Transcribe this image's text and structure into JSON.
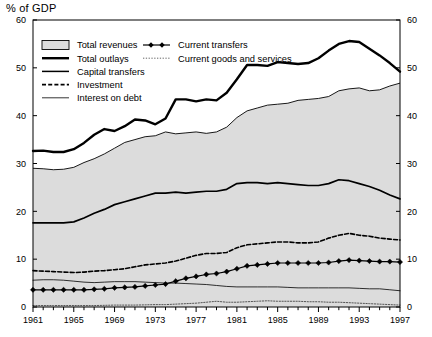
{
  "axis_title": "% of GDP",
  "legend": {
    "col1": [
      {
        "label": "Total revenues",
        "style": "area-swatch"
      },
      {
        "label": "Total outlays",
        "style": "thick-line"
      },
      {
        "label": "Capital transfers",
        "style": "medium-line"
      },
      {
        "label": "Investment",
        "style": "dashed-line"
      },
      {
        "label": "Interest on debt",
        "style": "thin-line"
      }
    ],
    "col2": [
      {
        "label": "Current transfers",
        "style": "marker-line"
      },
      {
        "label": "Current goods and services",
        "style": "dotted-line"
      }
    ]
  },
  "chart_data": {
    "type": "line",
    "title": "",
    "subtitle": "",
    "xlabel": "",
    "ylabel": "% of GDP",
    "ylim": [
      0,
      60
    ],
    "xlim": [
      1961,
      1997
    ],
    "yticks": [
      0,
      10,
      20,
      30,
      40,
      50,
      60
    ],
    "xticks": [
      1961,
      1965,
      1969,
      1973,
      1977,
      1981,
      1985,
      1989,
      1993,
      1997
    ],
    "tick_labels_x": [
      "1961",
      "1965",
      "1969",
      "1973",
      "1977",
      "1981",
      "1985",
      "1989",
      "1993",
      "1997"
    ],
    "tick_labels_y": [
      "0",
      "10",
      "20",
      "30",
      "40",
      "50",
      "60"
    ],
    "grid": false,
    "legend_position": "top-left",
    "dual_axis": true,
    "x": [
      1961,
      1962,
      1963,
      1964,
      1965,
      1966,
      1967,
      1968,
      1969,
      1970,
      1971,
      1972,
      1973,
      1974,
      1975,
      1976,
      1977,
      1978,
      1979,
      1980,
      1981,
      1982,
      1983,
      1984,
      1985,
      1986,
      1987,
      1988,
      1989,
      1990,
      1991,
      1992,
      1993,
      1994,
      1995,
      1996,
      1997
    ],
    "series": [
      {
        "name": "Total revenues",
        "style": "area",
        "fill": "#dcdcdc",
        "values": [
          29.0,
          28.9,
          28.7,
          28.8,
          29.2,
          30.2,
          31.0,
          32.0,
          33.2,
          34.4,
          35.0,
          35.6,
          35.8,
          36.6,
          36.2,
          36.4,
          36.6,
          36.3,
          36.6,
          37.6,
          39.6,
          41.0,
          41.6,
          42.2,
          42.4,
          42.6,
          43.2,
          43.4,
          43.6,
          44.0,
          45.2,
          45.6,
          45.8,
          45.2,
          45.4,
          46.2,
          46.8
        ]
      },
      {
        "name": "Total outlays",
        "style": "thick",
        "color": "#000000",
        "values": [
          32.6,
          32.7,
          32.4,
          32.4,
          33.0,
          34.3,
          36.0,
          37.2,
          36.8,
          37.8,
          39.2,
          39.0,
          38.2,
          39.4,
          43.4,
          43.4,
          43.0,
          43.4,
          43.2,
          44.8,
          47.6,
          50.6,
          50.6,
          50.4,
          51.2,
          51.0,
          50.8,
          51.0,
          52.0,
          53.6,
          55.0,
          55.6,
          55.4,
          54.0,
          52.6,
          51.0,
          49.2
        ]
      },
      {
        "name": "Capital transfers",
        "style": "medium",
        "color": "#000000",
        "values": [
          17.6,
          17.6,
          17.6,
          17.6,
          17.8,
          18.6,
          19.6,
          20.4,
          21.4,
          22.0,
          22.6,
          23.2,
          23.8,
          23.8,
          24.0,
          23.8,
          24.0,
          24.2,
          24.2,
          24.6,
          25.8,
          26.0,
          26.0,
          25.8,
          26.0,
          25.8,
          25.6,
          25.4,
          25.4,
          25.8,
          26.6,
          26.4,
          25.8,
          25.2,
          24.4,
          23.4,
          22.6
        ]
      },
      {
        "name": "Investment",
        "style": "dashed",
        "color": "#000000",
        "values": [
          7.6,
          7.5,
          7.4,
          7.3,
          7.2,
          7.3,
          7.5,
          7.6,
          7.8,
          8.0,
          8.4,
          8.8,
          9.0,
          9.2,
          9.6,
          10.2,
          10.8,
          11.2,
          11.2,
          11.4,
          12.4,
          13.0,
          13.2,
          13.4,
          13.6,
          13.6,
          13.4,
          13.4,
          13.6,
          14.4,
          15.0,
          15.4,
          15.0,
          14.8,
          14.4,
          14.2,
          14.0
        ]
      },
      {
        "name": "Interest on debt",
        "style": "thin",
        "color": "#000000",
        "values": [
          5.6,
          5.7,
          5.7,
          5.6,
          5.4,
          5.2,
          5.1,
          5.2,
          5.3,
          5.3,
          5.3,
          5.2,
          5.1,
          5.0,
          5.0,
          4.9,
          4.8,
          4.7,
          4.5,
          4.3,
          4.2,
          4.2,
          4.2,
          4.2,
          4.2,
          4.1,
          4.0,
          4.0,
          4.0,
          4.0,
          4.0,
          4.0,
          3.9,
          3.8,
          3.8,
          3.6,
          3.4
        ]
      },
      {
        "name": "Current transfers",
        "style": "marker",
        "color": "#000000",
        "values": [
          3.6,
          3.6,
          3.6,
          3.6,
          3.6,
          3.6,
          3.7,
          3.8,
          4.0,
          4.1,
          4.2,
          4.4,
          4.6,
          4.8,
          5.4,
          6.0,
          6.4,
          6.8,
          7.0,
          7.4,
          8.0,
          8.6,
          8.8,
          9.0,
          9.2,
          9.2,
          9.2,
          9.2,
          9.2,
          9.3,
          9.6,
          9.8,
          9.7,
          9.6,
          9.5,
          9.5,
          9.4
        ]
      },
      {
        "name": "Current goods and services",
        "style": "dotted",
        "color": "#444444",
        "values": [
          0.3,
          0.3,
          0.3,
          0.3,
          0.3,
          0.3,
          0.3,
          0.35,
          0.4,
          0.4,
          0.4,
          0.45,
          0.5,
          0.5,
          0.6,
          0.7,
          0.8,
          1.0,
          1.2,
          1.0,
          1.0,
          1.1,
          1.2,
          1.3,
          1.2,
          1.2,
          1.2,
          1.1,
          1.1,
          1.0,
          1.0,
          0.9,
          0.8,
          0.7,
          0.6,
          0.5,
          0.4
        ]
      }
    ]
  }
}
